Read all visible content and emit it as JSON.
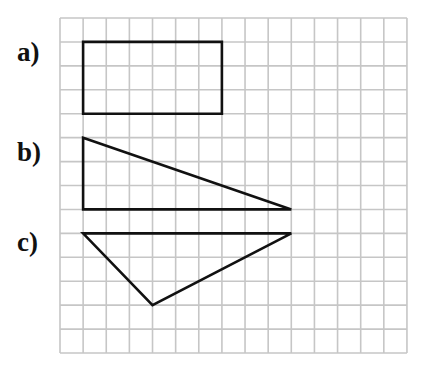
{
  "diagram": {
    "type": "grid-shapes",
    "grid": {
      "origin_px": [
        60,
        18
      ],
      "columns": 15,
      "rows": 14,
      "cell_width_px": 23.13,
      "cell_height_px": 23.93,
      "line_color": "#c6c6c6",
      "background": "#ffffff"
    },
    "stroke_color": "#111111",
    "shapes": [
      {
        "label": "a)",
        "kind": "rectangle",
        "label_pos_px": [
          17,
          39
        ],
        "points": [
          [
            1,
            1
          ],
          [
            7,
            1
          ],
          [
            7,
            4
          ],
          [
            1,
            4
          ]
        ]
      },
      {
        "label": "b)",
        "kind": "right-triangle",
        "label_pos_px": [
          17,
          139
        ],
        "points": [
          [
            1,
            5
          ],
          [
            10,
            8
          ],
          [
            1,
            8
          ]
        ]
      },
      {
        "label": "c)",
        "kind": "triangle",
        "label_pos_px": [
          17,
          229
        ],
        "points": [
          [
            1,
            9
          ],
          [
            10,
            9
          ],
          [
            4,
            12
          ]
        ]
      }
    ]
  }
}
